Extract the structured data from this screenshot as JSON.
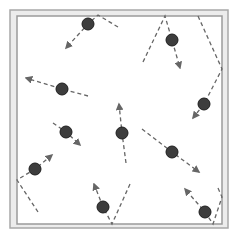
{
  "diagram": {
    "container": {
      "outer": {
        "x": 10,
        "y": 10,
        "w": 218,
        "h": 218
      },
      "inner": {
        "x": 17,
        "y": 16,
        "w": 205,
        "h": 208
      },
      "outer_stroke": "#a8a8a8",
      "wall_fill": "#ececec",
      "inner_stroke": "#9a9a9a"
    },
    "colors": {
      "particle_fill": "#3d3d3d",
      "particle_stroke": "#1e1e1e",
      "path_stroke": "#666666"
    },
    "particle_radius": 6,
    "particles": [
      {
        "id": 1,
        "cx": 88,
        "cy": 24,
        "path": [
          [
            118,
            27
          ],
          [
            98,
            15
          ],
          [
            88,
            24
          ],
          [
            66,
            48
          ]
        ]
      },
      {
        "id": 2,
        "cx": 172,
        "cy": 40,
        "path": [
          [
            143,
            62
          ],
          [
            165,
            16
          ],
          [
            172,
            40
          ],
          [
            180,
            68
          ]
        ]
      },
      {
        "id": 3,
        "cx": 204,
        "cy": 104,
        "path": [
          [
            198,
            16
          ],
          [
            222,
            69
          ],
          [
            204,
            104
          ],
          [
            193,
            118
          ]
        ]
      },
      {
        "id": 4,
        "cx": 62,
        "cy": 89,
        "path": [
          [
            88,
            96
          ],
          [
            62,
            89
          ],
          [
            26,
            78
          ]
        ]
      },
      {
        "id": 5,
        "cx": 66,
        "cy": 132,
        "path": [
          [
            53,
            123
          ],
          [
            66,
            132
          ],
          [
            80,
            145
          ]
        ]
      },
      {
        "id": 6,
        "cx": 122,
        "cy": 133,
        "path": [
          [
            126,
            163
          ],
          [
            122,
            133
          ],
          [
            119,
            104
          ]
        ]
      },
      {
        "id": 7,
        "cx": 172,
        "cy": 152,
        "path": [
          [
            142,
            129
          ],
          [
            172,
            152
          ],
          [
            199,
            172
          ]
        ]
      },
      {
        "id": 8,
        "cx": 35,
        "cy": 169,
        "path": [
          [
            38,
            212
          ],
          [
            17,
            180
          ],
          [
            35,
            169
          ],
          [
            52,
            155
          ]
        ]
      },
      {
        "id": 9,
        "cx": 103,
        "cy": 207,
        "path": [
          [
            130,
            184
          ],
          [
            112,
            224
          ],
          [
            103,
            207
          ],
          [
            94,
            184
          ]
        ]
      },
      {
        "id": 10,
        "cx": 205,
        "cy": 212,
        "path": [
          [
            218,
            188
          ],
          [
            222,
            197
          ],
          [
            213,
            224
          ],
          [
            205,
            212
          ],
          [
            185,
            189
          ]
        ]
      }
    ]
  }
}
